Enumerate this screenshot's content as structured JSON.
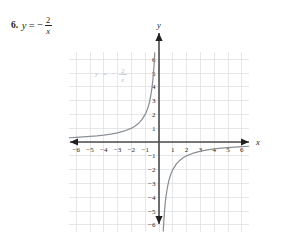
{
  "problem": {
    "number": "6.",
    "equation": {
      "lhs": "y",
      "equals": "=",
      "sign": "−",
      "numerator": "2",
      "denominator": "x",
      "plain": "y = -2/x"
    }
  },
  "watermark": {
    "lhs": "y",
    "equals": "=",
    "sign": "−",
    "numerator": "2",
    "denominator": "x",
    "color": "#b9bec4"
  },
  "axes": {
    "x_label": "x",
    "y_label": "y",
    "x_ticks": [
      "−6",
      "−5",
      "−4",
      "−3",
      "−2",
      "−1",
      "1",
      "2",
      "3",
      "4",
      "5",
      "6"
    ],
    "y_ticks": [
      "6",
      "5",
      "4",
      "3",
      "2",
      "1",
      "−1",
      "−2",
      "−3",
      "−4",
      "−5",
      "−6"
    ],
    "axis_color": "#4c4c4c",
    "grid_color": "#dcdde0"
  },
  "chart_data": {
    "type": "line",
    "title": "",
    "subtitle": "",
    "xlabel": "x",
    "ylabel": "y",
    "xlim": [
      -6.5,
      6.5
    ],
    "ylim": [
      -6.5,
      6.5
    ],
    "grid": true,
    "legend": "none",
    "annotations": [
      "y = -2/x"
    ],
    "xticks": [
      -6,
      -5,
      -4,
      -3,
      -2,
      -1,
      1,
      2,
      3,
      4,
      5,
      6
    ],
    "yticks": [
      -6,
      -5,
      -4,
      -3,
      -2,
      -1,
      1,
      2,
      3,
      4,
      5,
      6
    ],
    "function": "y = -2/x",
    "curve_color": "#8a8f96",
    "series": [
      {
        "name": "branch-quadrant-II",
        "x": [
          -6.5,
          -6,
          -5.5,
          -5,
          -4.5,
          -4,
          -3.5,
          -3,
          -2.5,
          -2,
          -1.75,
          -1.5,
          -1.25,
          -1,
          -0.9,
          -0.8,
          -0.7,
          -0.6,
          -0.5,
          -0.45,
          -0.4,
          -0.36,
          -0.33,
          -0.31
        ],
        "y": [
          0.308,
          0.333,
          0.364,
          0.4,
          0.444,
          0.5,
          0.571,
          0.667,
          0.8,
          1.0,
          1.143,
          1.333,
          1.6,
          2.0,
          2.222,
          2.5,
          2.857,
          3.333,
          4.0,
          4.444,
          5.0,
          5.556,
          6.061,
          6.452
        ]
      },
      {
        "name": "branch-quadrant-IV",
        "x": [
          0.31,
          0.33,
          0.36,
          0.4,
          0.45,
          0.5,
          0.6,
          0.7,
          0.8,
          0.9,
          1.0,
          1.25,
          1.5,
          1.75,
          2.0,
          2.5,
          3.0,
          3.5,
          4.0,
          4.5,
          5.0,
          5.5,
          6.0,
          6.5
        ],
        "y": [
          -6.452,
          -6.061,
          -5.556,
          -5.0,
          -4.444,
          -4.0,
          -3.333,
          -2.857,
          -2.5,
          -2.222,
          -2.0,
          -1.6,
          -1.333,
          -1.143,
          -1.0,
          -0.8,
          -0.667,
          -0.571,
          -0.5,
          -0.444,
          -0.4,
          -0.364,
          -0.333,
          -0.308
        ]
      }
    ]
  }
}
